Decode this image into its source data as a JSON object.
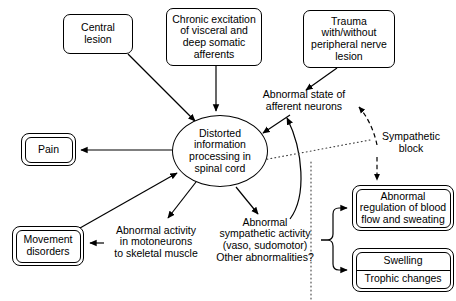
{
  "diagram": {
    "nodes": [
      {
        "id": "central-lesion",
        "label": "Central\nlesion",
        "shape": "box",
        "x": 63,
        "y": 14,
        "w": 70,
        "h": 40
      },
      {
        "id": "chronic-excitation",
        "label": "Chronic excitation\nof visceral and\ndeep somatic\nafferents",
        "shape": "box",
        "x": 166,
        "y": 8,
        "w": 96,
        "h": 58
      },
      {
        "id": "trauma",
        "label": "Trauma\nwith/without\nperipheral nerve\nlesion",
        "shape": "box",
        "x": 303,
        "y": 10,
        "w": 92,
        "h": 58
      },
      {
        "id": "abnormal-afferent",
        "label": "Abnormal state of\nafferent neurons",
        "shape": "plain",
        "x": 252,
        "y": 88,
        "w": 104,
        "h": 26
      },
      {
        "id": "distorted-processing",
        "label": "Distorted\ninformation\nprocessing in\nspinal cord",
        "shape": "ellipse",
        "x": 172,
        "y": 115,
        "w": 96,
        "h": 72
      },
      {
        "id": "pain",
        "label": "Pain",
        "shape": "box2",
        "x": 21,
        "y": 133,
        "w": 55,
        "h": 33
      },
      {
        "id": "movement-disorders",
        "label": "Movement\ndisorders",
        "shape": "box2",
        "x": 12,
        "y": 226,
        "w": 72,
        "h": 40
      },
      {
        "id": "abnormal-motoneurons",
        "label": "Abnormal activity\nin motoneurons\nto skeletal muscle",
        "shape": "plain",
        "x": 104,
        "y": 222,
        "w": 104,
        "h": 40
      },
      {
        "id": "abnormal-sympathetic",
        "label": "Abnormal\nsympathetic activity\n(vaso, sudomotor)\nOther abnormalities?",
        "shape": "plain",
        "x": 210,
        "y": 213,
        "w": 110,
        "h": 54
      },
      {
        "id": "sympathetic-block",
        "label": "Sympathetic\nblock",
        "shape": "plain",
        "x": 370,
        "y": 130,
        "w": 82,
        "h": 26
      },
      {
        "id": "abnormal-regulation",
        "label": "Abnormal\nregulation of blood\nflow and sweating",
        "shape": "box2",
        "x": 352,
        "y": 185,
        "w": 102,
        "h": 46
      },
      {
        "id": "swelling-trophic",
        "label": "Swelling|Trophic changes",
        "shape": "box2",
        "x": 352,
        "y": 248,
        "w": 102,
        "h": 44,
        "segments": [
          "Swelling",
          "Trophic changes"
        ]
      }
    ],
    "edges": [
      {
        "id": "edge-central-to-distorted",
        "from": "central-lesion",
        "to": "distorted-processing",
        "style": "solid",
        "arrow": "end"
      },
      {
        "id": "edge-chronic-to-distorted",
        "from": "chronic-excitation",
        "to": "distorted-processing",
        "style": "solid",
        "arrow": "end"
      },
      {
        "id": "edge-trauma-to-afferent",
        "from": "trauma",
        "to": "abnormal-afferent",
        "style": "solid",
        "arrow": "end"
      },
      {
        "id": "edge-afferent-to-distorted",
        "from": "abnormal-afferent",
        "to": "distorted-processing",
        "style": "solid",
        "arrow": "end"
      },
      {
        "id": "edge-distorted-to-pain",
        "from": "distorted-processing",
        "to": "pain",
        "style": "solid",
        "arrow": "end"
      },
      {
        "id": "edge-distorted-to-motoneurons",
        "from": "distorted-processing",
        "to": "abnormal-motoneurons",
        "style": "solid",
        "arrow": "end"
      },
      {
        "id": "edge-distorted-to-sympathetic",
        "from": "distorted-processing",
        "to": "abnormal-sympathetic",
        "style": "solid",
        "arrow": "end"
      },
      {
        "id": "edge-motoneurons-to-movement",
        "from": "abnormal-motoneurons",
        "to": "movement-disorders",
        "style": "solid",
        "arrow": "end"
      },
      {
        "id": "edge-movement-to-distorted",
        "from": "movement-disorders",
        "to": "distorted-processing",
        "style": "solid",
        "arrow": "end"
      },
      {
        "id": "edge-sympathetic-to-afferent",
        "from": "abnormal-sympathetic",
        "to": "abnormal-afferent",
        "style": "solid",
        "arrow": "end"
      },
      {
        "id": "edge-sympathetic-to-regulation",
        "from": "abnormal-sympathetic",
        "to": "abnormal-regulation",
        "style": "solid",
        "arrow": "end"
      },
      {
        "id": "edge-sympathetic-to-swelling",
        "from": "abnormal-sympathetic",
        "to": "swelling-trophic",
        "style": "solid",
        "arrow": "end"
      },
      {
        "id": "edge-block-to-afferent",
        "from": "sympathetic-block",
        "to": "abnormal-afferent",
        "style": "dashed",
        "arrow": "end"
      },
      {
        "id": "edge-block-to-regulation",
        "from": "sympathetic-block",
        "to": "abnormal-regulation",
        "style": "dashed",
        "arrow": "end"
      },
      {
        "id": "edge-block-dotted-marker",
        "from": "sympathetic-block",
        "to": "pathway-divider",
        "style": "dotted",
        "arrow": "none"
      }
    ],
    "colors": {
      "stroke": "#000000",
      "text": "#000000",
      "background": "#ffffff"
    }
  }
}
